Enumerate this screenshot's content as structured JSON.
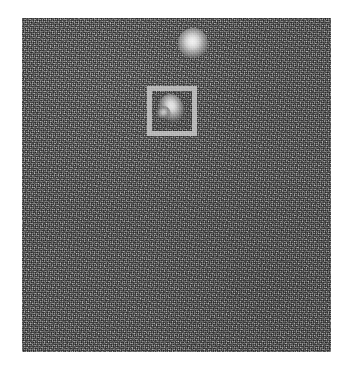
{
  "figure": {
    "type": "noisy-grayscale-detection-image",
    "width": 353,
    "height": 374,
    "page_background": "#ffffff"
  },
  "image_panel": {
    "name": "noisy-grayscale-image",
    "x": 22,
    "y": 18,
    "width": 309,
    "height": 334,
    "mean_gray": "#6a6a6a",
    "texture": "fine-grained monochrome speckle noise",
    "border": "none"
  },
  "objects": [
    {
      "id": "blob-upper",
      "label": "bright-blob-unannotated",
      "shape": "round-diffuse",
      "center_x": 193,
      "center_y": 43,
      "width": 30,
      "height": 30,
      "peak_gray": "#f2f2f2",
      "annotated": false
    },
    {
      "id": "blob-boxed",
      "label": "bright-blob-annotated",
      "shape": "teardrop-comma",
      "center_x": 171,
      "center_y": 110,
      "width": 34,
      "height": 36,
      "peak_gray": "#f5f5f5",
      "annotated": true
    }
  ],
  "annotations": [
    {
      "id": "bbox-1",
      "type": "bounding-box",
      "target": "blob-boxed",
      "x": 147,
      "y": 86,
      "width": 50,
      "height": 50,
      "stroke_color": "#b9b9b9",
      "stroke_width": 5,
      "fill": "none",
      "caption": ""
    }
  ],
  "labels": {
    "title": "",
    "caption": "",
    "axis_x": "",
    "axis_y": "",
    "colorbar": ""
  }
}
